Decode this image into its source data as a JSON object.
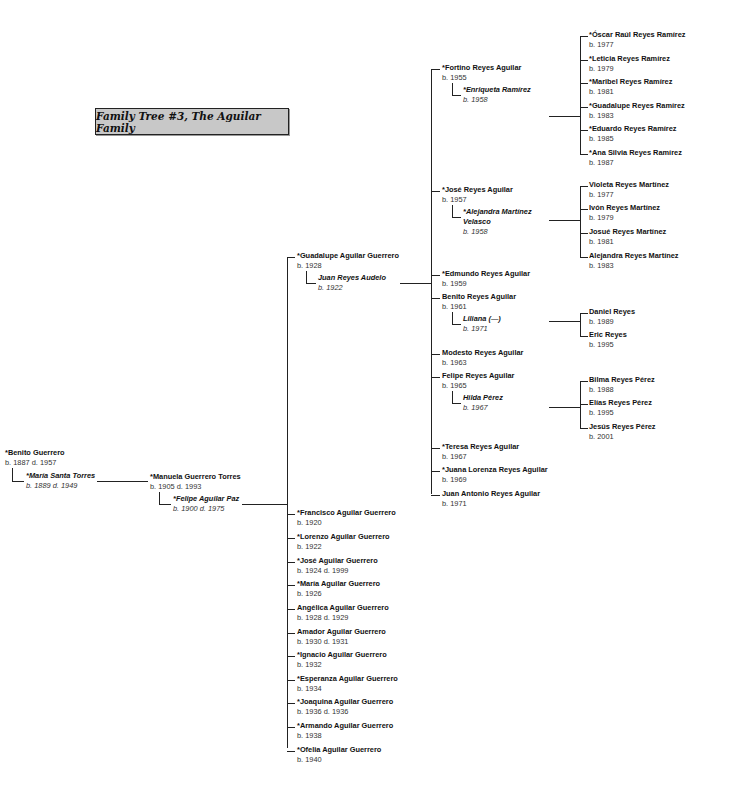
{
  "title": "Family Tree #3, The Aguilar Family",
  "generation1": {
    "person": {
      "name": "*Benito Guerrero",
      "dates": "b. 1887 d. 1957"
    },
    "spouse": {
      "name": "*María Santa Torres",
      "dates": "b. 1889 d. 1949"
    }
  },
  "generation2": {
    "person": {
      "name": "*Manuela Guerrero Torres",
      "dates": "b. 1905 d. 1993"
    },
    "spouse": {
      "name": "*Felipe Aguilar Paz",
      "dates": "b. 1900 d. 1975"
    }
  },
  "generation3": {
    "guadalupe": {
      "name": "*Guadalupe Aguilar Guerrero",
      "dates": "b. 1928"
    },
    "guadalupe_spouse": {
      "name": "Juan Reyes Audelo",
      "dates": "b. 1922"
    },
    "siblings": [
      {
        "name": "*Francisco Aguilar Guerrero",
        "dates": "b. 1920"
      },
      {
        "name": "*Lorenzo Aguilar Guerrero",
        "dates": "b. 1922"
      },
      {
        "name": "*José Aguilar Guerrero",
        "dates": "b. 1924 d. 1999"
      },
      {
        "name": "*María Aguilar Guerrero",
        "dates": "b. 1926"
      },
      {
        "name": "Angélica Aguilar Guerrero",
        "dates": "b. 1928 d. 1929"
      },
      {
        "name": "Amador Aguilar Guerrero",
        "dates": "b. 1930 d. 1931"
      },
      {
        "name": "*Ignacio Aguilar Guerrero",
        "dates": "b. 1932"
      },
      {
        "name": "*Esperanza Aguilar Guerrero",
        "dates": "b. 1934"
      },
      {
        "name": "*Joaquina Aguilar Guerrero",
        "dates": "b. 1936 d. 1936"
      },
      {
        "name": "*Armando Aguilar Guerrero",
        "dates": "b. 1938"
      },
      {
        "name": "*Ofelia Aguilar Guerrero",
        "dates": "b. 1940"
      }
    ]
  },
  "generation4": [
    {
      "name": "*Fortino Reyes Aguilar",
      "dates": "b. 1955",
      "spouse": {
        "name": "*Enriqueta Ramírez",
        "dates": "b. 1958"
      },
      "children": [
        {
          "name": "*Óscar Raúl Reyes Ramírez",
          "dates": "b. 1977"
        },
        {
          "name": "*Leticia Reyes Ramírez",
          "dates": "b. 1979"
        },
        {
          "name": "*Maribel Reyes Ramírez",
          "dates": "b. 1981"
        },
        {
          "name": "*Guadalupe Reyes Ramírez",
          "dates": "b. 1983"
        },
        {
          "name": "*Eduardo Reyes Ramírez",
          "dates": "b. 1985"
        },
        {
          "name": "*Ana Silvia Reyes Ramírez",
          "dates": "b. 1987"
        }
      ]
    },
    {
      "name": "*José Reyes Aguilar",
      "dates": "b. 1957",
      "spouse": {
        "name": "*Alejandra Martínez Velasco",
        "dates": "b. 1958"
      },
      "children": [
        {
          "name": "Violeta Reyes Martínez",
          "dates": "b. 1977"
        },
        {
          "name": "Ivón Reyes Martínez",
          "dates": "b. 1979"
        },
        {
          "name": "Josué Reyes Martínez",
          "dates": "b. 1981"
        },
        {
          "name": "Alejandra Reyes Martínez",
          "dates": "b. 1983"
        }
      ]
    },
    {
      "name": "*Edmundo Reyes Aguilar",
      "dates": "b. 1959"
    },
    {
      "name": "Benito Reyes Aguilar",
      "dates": "b. 1961",
      "spouse": {
        "name": "Liliana (—)",
        "dates": "b. 1971"
      },
      "children": [
        {
          "name": "Daniel Reyes",
          "dates": "b. 1989"
        },
        {
          "name": "Eric Reyes",
          "dates": "b. 1995"
        }
      ]
    },
    {
      "name": "Modesto Reyes Aguilar",
      "dates": "b. 1963"
    },
    {
      "name": "Felipe Reyes Aguilar",
      "dates": "b. 1965",
      "spouse": {
        "name": "Hilda Pérez",
        "dates": "b. 1967"
      },
      "children": [
        {
          "name": "Bilma Reyes Pérez",
          "dates": "b. 1988"
        },
        {
          "name": "Elías Reyes Pérez",
          "dates": "b. 1995"
        },
        {
          "name": "Jesús Reyes Pérez",
          "dates": "b. 2001"
        }
      ]
    },
    {
      "name": "*Teresa Reyes Aguilar",
      "dates": "b. 1967"
    },
    {
      "name": "*Juana Lorenza Reyes Aguilar",
      "dates": "b. 1969"
    },
    {
      "name": "Juan Antonio Reyes Aguilar",
      "dates": "b. 1971"
    }
  ]
}
